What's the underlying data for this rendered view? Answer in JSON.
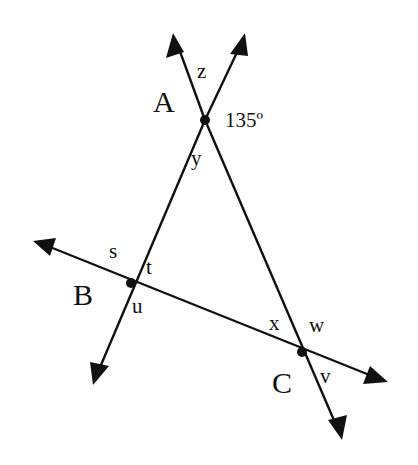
{
  "diagram": {
    "type": "geometry-lines-triangle",
    "stroke_color": "#111111",
    "background": "#ffffff",
    "points": {
      "A": {
        "label": "A",
        "x": 205,
        "y": 120
      },
      "B": {
        "label": "B",
        "x": 131,
        "y": 283
      },
      "C": {
        "label": "C",
        "x": 302,
        "y": 352
      }
    },
    "angle_labels": {
      "given": "135º",
      "z": "z",
      "y": "y",
      "s": "s",
      "t": "t",
      "u": "u",
      "x": "x",
      "w": "w",
      "v": "v"
    },
    "lines": [
      {
        "name": "line-AC",
        "through": [
          "A",
          "C"
        ]
      },
      {
        "name": "line-AB",
        "through": [
          "A",
          "B"
        ]
      },
      {
        "name": "line-BC",
        "through": [
          "B",
          "C"
        ]
      }
    ]
  }
}
